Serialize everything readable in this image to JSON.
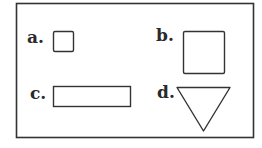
{
  "figure": {
    "frame": {
      "x": 16,
      "y": 3,
      "width": 238,
      "height": 134,
      "stroke": "#333333"
    },
    "items": [
      {
        "label": "a.",
        "shape": "square",
        "size": "small"
      },
      {
        "label": "b.",
        "shape": "square",
        "size": "large"
      },
      {
        "label": "c.",
        "shape": "rectangle",
        "size": "wide"
      },
      {
        "label": "d.",
        "shape": "triangle",
        "orientation": "inverted"
      }
    ],
    "colors": {
      "stroke": "#333333",
      "fill": "#ffffff",
      "text": "#2a2a2a"
    }
  }
}
